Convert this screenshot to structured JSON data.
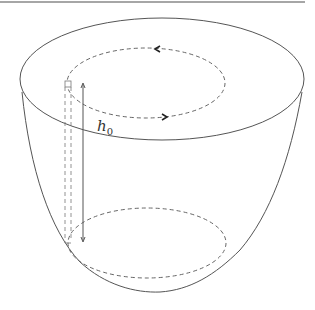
{
  "figure": {
    "type": "diagram",
    "labels": {
      "height_symbol": "h",
      "height_subscript": "0"
    },
    "colors": {
      "stroke": "#555555",
      "dashed": "#666666",
      "background": "#ffffff"
    }
  }
}
